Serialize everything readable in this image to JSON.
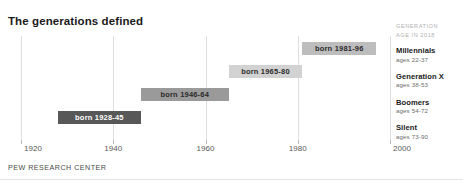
{
  "title": "The generations defined",
  "source_note": "PEW RESEARCH CENTER",
  "legend": {
    "header_line1": "GENERATION",
    "header_line2": "AGE IN 2018",
    "items": [
      {
        "name": "Millennials",
        "ages": "ages 22-37"
      },
      {
        "name": "Generation X",
        "ages": "ages 38-53"
      },
      {
        "name": "Boomers",
        "ages": "ages 54-72"
      },
      {
        "name": "Silent",
        "ages": "ages 73-90"
      }
    ]
  },
  "chart_data": {
    "type": "bar",
    "orientation": "horizontal-range",
    "title": "The generations defined",
    "xlabel": "",
    "ylabel": "",
    "xlim": [
      1920,
      2000
    ],
    "grid": true,
    "legend_position": "right",
    "tick_labels": [
      "1920",
      "1940",
      "1960",
      "1980",
      "2000"
    ],
    "ticks": [
      1920,
      1940,
      1960,
      1980,
      2000
    ],
    "categories": [
      "Millennials",
      "Generation X",
      "Boomers",
      "Silent"
    ],
    "bars": [
      {
        "category": "Millennials",
        "label": "born 1981-96",
        "start": 1981,
        "end": 1996,
        "ages": "ages 22-37",
        "color": "#bdbdbd",
        "text_color": "#2b2b2b"
      },
      {
        "category": "Generation X",
        "label": "born 1965-80",
        "start": 1965,
        "end": 1980,
        "ages": "ages 38-53",
        "color": "#d2d2d2",
        "text_color": "#2b2b2b"
      },
      {
        "category": "Boomers",
        "label": "born 1946-64",
        "start": 1946,
        "end": 1964,
        "ages": "ages 54-72",
        "color": "#9a9a9a",
        "text_color": "#2b2b2b"
      },
      {
        "category": "Silent",
        "label": "born 1928-45",
        "start": 1928,
        "end": 1945,
        "ages": "ages 73-90",
        "color": "#585858",
        "text_color": "#ffffff"
      }
    ]
  }
}
